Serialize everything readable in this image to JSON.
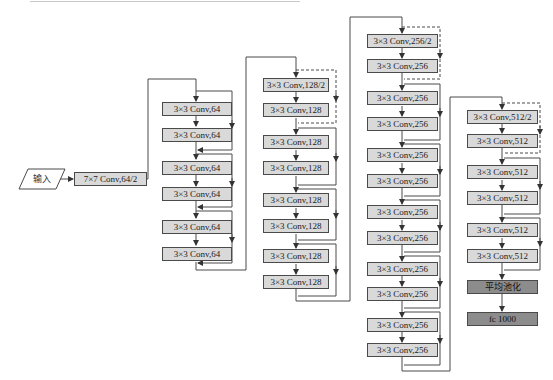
{
  "input": {
    "label": "输入"
  },
  "stem": {
    "label": "7×7 Conv,64/2"
  },
  "stage1": {
    "boxes": [
      "3×3 Conv,64",
      "3×3 Conv,64",
      "3×3 Conv,64",
      "3×3 Conv,64",
      "3×3 Conv,64",
      "3×3 Conv,64"
    ]
  },
  "stage2": {
    "boxes": [
      "3×3 Conv,128/2",
      "3×3 Conv,128",
      "3×3 Conv,128",
      "3×3 Conv,128",
      "3×3 Conv,128",
      "3×3 Conv,128",
      "3×3 Conv,128",
      "3×3 Conv,128"
    ]
  },
  "stage3": {
    "boxes": [
      "3×3 Conv,256/2",
      "3×3 Conv,256",
      "3×3 Conv,256",
      "3×3 Conv,256",
      "3×3 Conv,256",
      "3×3 Conv,256",
      "3×3 Conv,256",
      "3×3 Conv,256",
      "3×3 Conv,256",
      "3×3 Conv,256",
      "3×3 Conv,256",
      "3×3 Conv,256"
    ]
  },
  "stage4": {
    "boxes": [
      "3×3 Conv,512/2",
      "3×3 Conv,512",
      "3×3 Conv,512",
      "3×3 Conv,512",
      "3×3 Conv,512",
      "3×3 Conv,512"
    ]
  },
  "head": {
    "pool": "平均池化",
    "fc": "fc 1000"
  },
  "colors": {
    "box_fill": "#d9d9d9",
    "head_fill": "#8c8c8c",
    "line": "#4a4a4a"
  }
}
